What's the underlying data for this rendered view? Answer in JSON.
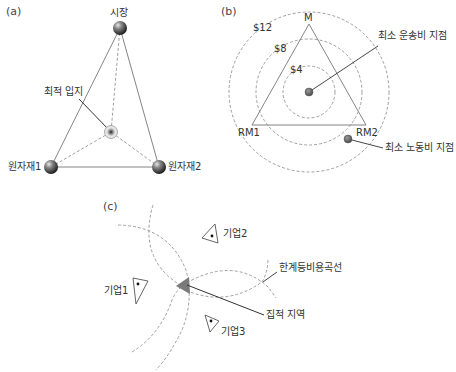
{
  "panels": {
    "a": {
      "label": "(a)",
      "market": "시장",
      "optimal_location": "최적 입지",
      "raw_material_1": "원자재1",
      "raw_material_2": "원자재2"
    },
    "b": {
      "label": "(b)",
      "market": "M",
      "raw_material_1": "RM1",
      "raw_material_2": "RM2",
      "isodapanes": [
        "$12",
        "$8",
        "$4"
      ],
      "min_transport_point": "최소 운송비 지점",
      "min_labor_point": "최소 노동비 지점"
    },
    "c": {
      "label": "(c)",
      "firm_1": "기업1",
      "firm_2": "기업2",
      "firm_3": "기업3",
      "critical_isodapane": "한계등비용곡선",
      "agglomeration_area": "집적 지역"
    }
  },
  "colors": {
    "line": "#666666",
    "dashed": "#777777",
    "sphere_dark": "#2a2a2a",
    "sphere_light": "#bdbdbd",
    "point_fill": "#6a6a6a",
    "agglomeration_fill": "#7a7a7a"
  }
}
